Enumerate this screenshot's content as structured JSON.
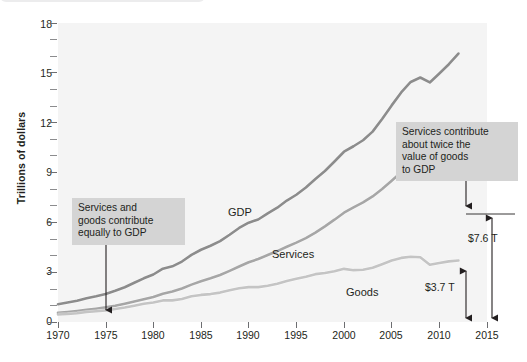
{
  "chart_data": {
    "type": "line",
    "title": "",
    "subtitle": "",
    "xlabel": "",
    "ylabel": "Trillions of dollars",
    "xlim": [
      1970,
      2015
    ],
    "ylim": [
      0,
      18
    ],
    "grid": false,
    "legend_position": "inline-series-labels",
    "x_ticks": [
      1970,
      1975,
      1980,
      1985,
      1990,
      1995,
      2000,
      2005,
      2010,
      2015
    ],
    "y_ticks": [
      0,
      3,
      6,
      9,
      12,
      15,
      18
    ],
    "y_minor_ticks": [
      1,
      2,
      4,
      5,
      7,
      8,
      10,
      11,
      13,
      14,
      16,
      17
    ],
    "x": [
      1970,
      1971,
      1972,
      1973,
      1974,
      1975,
      1976,
      1977,
      1978,
      1979,
      1980,
      1981,
      1982,
      1983,
      1984,
      1985,
      1986,
      1987,
      1988,
      1989,
      1990,
      1991,
      1992,
      1993,
      1994,
      1995,
      1996,
      1997,
      1998,
      1999,
      2000,
      2001,
      2002,
      2003,
      2004,
      2005,
      2006,
      2007,
      2008,
      2009,
      2010,
      2011,
      2012
    ],
    "series": [
      {
        "name": "GDP",
        "color": "#8c8c8c",
        "values": [
          1.07,
          1.17,
          1.28,
          1.43,
          1.55,
          1.69,
          1.88,
          2.09,
          2.36,
          2.63,
          2.86,
          3.21,
          3.35,
          3.64,
          4.04,
          4.35,
          4.59,
          4.87,
          5.25,
          5.66,
          5.98,
          6.17,
          6.54,
          6.88,
          7.31,
          7.66,
          8.1,
          8.61,
          9.09,
          9.66,
          10.25,
          10.58,
          10.94,
          11.46,
          12.22,
          13.04,
          13.82,
          14.45,
          14.72,
          14.42,
          14.96,
          15.52,
          16.16
        ]
      },
      {
        "name": "Services",
        "color": "#a6a6a6",
        "values": [
          0.55,
          0.6,
          0.66,
          0.73,
          0.8,
          0.88,
          0.98,
          1.1,
          1.23,
          1.37,
          1.51,
          1.7,
          1.83,
          2.02,
          2.25,
          2.45,
          2.63,
          2.83,
          3.08,
          3.34,
          3.6,
          3.79,
          4.03,
          4.27,
          4.53,
          4.78,
          5.05,
          5.38,
          5.76,
          6.16,
          6.58,
          6.9,
          7.2,
          7.56,
          8.01,
          8.5,
          9.01,
          9.52,
          9.84,
          9.8,
          10.2,
          10.6,
          11.3
        ]
      },
      {
        "name": "Goods",
        "color": "#c4c4c4",
        "values": [
          0.45,
          0.48,
          0.53,
          0.6,
          0.65,
          0.7,
          0.78,
          0.87,
          0.98,
          1.1,
          1.17,
          1.3,
          1.3,
          1.38,
          1.55,
          1.63,
          1.68,
          1.77,
          1.91,
          2.03,
          2.1,
          2.1,
          2.18,
          2.3,
          2.47,
          2.6,
          2.73,
          2.88,
          2.95,
          3.05,
          3.2,
          3.12,
          3.15,
          3.27,
          3.48,
          3.7,
          3.86,
          3.93,
          3.9,
          3.45,
          3.55,
          3.65,
          3.7
        ]
      }
    ],
    "annotations": [
      {
        "id": "left-callout",
        "text": "Services and goods contribute equally to GDP",
        "lines": [
          "Services and",
          "goods contribute",
          "equally to GDP"
        ],
        "points_to_year": 1975,
        "box_color": "#d4d4d4"
      },
      {
        "id": "right-callout",
        "text": "Services contribute about twice the value of goods to GDP",
        "lines": [
          "Services contribute",
          "about twice the",
          "value of goods",
          "to GDP"
        ],
        "points_to_year": 2012,
        "box_color": "#d4d4d4"
      }
    ],
    "measurements": [
      {
        "id": "services-value",
        "label": "$7.6 T",
        "year": 2012,
        "value": 7.6
      },
      {
        "id": "goods-value",
        "label": "$3.7 T",
        "year": 2012,
        "value": 3.7
      }
    ]
  },
  "axis": {
    "y_title": "Trillions of dollars",
    "y_tick_labels": [
      "18",
      "15",
      "12",
      "9",
      "6",
      "3",
      "0"
    ],
    "x_tick_labels": [
      "1970",
      "1975",
      "1980",
      "1985",
      "1990",
      "1995",
      "2000",
      "2005",
      "2010",
      "2015"
    ]
  },
  "series_labels": {
    "gdp": "GDP",
    "services": "Services",
    "goods": "Goods"
  },
  "callouts": {
    "left": {
      "line1": "Services and",
      "line2": "goods contribute",
      "line3": "equally to GDP"
    },
    "right": {
      "line1": "Services contribute",
      "line2": "about twice the",
      "line3": "value of goods",
      "line4": "to GDP"
    }
  },
  "measures": {
    "services_gap": "$7.6 T",
    "goods_gap": "$3.7 T"
  }
}
